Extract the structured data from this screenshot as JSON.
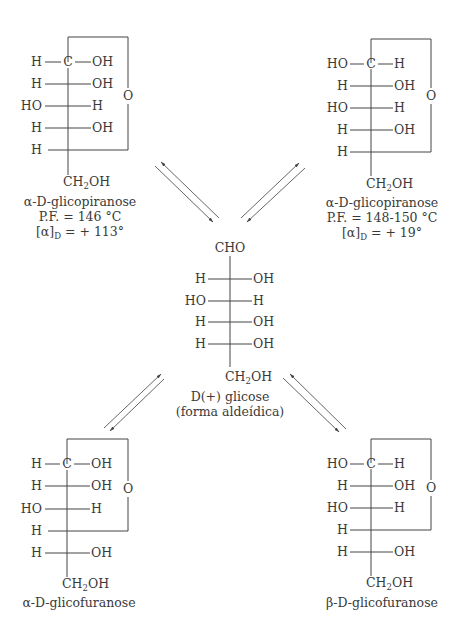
{
  "diagram": {
    "top_left": {
      "name": "α-D-glicopiranose",
      "ring_o": "O",
      "rows": [
        {
          "left": "H",
          "center": "C",
          "right": "OH"
        },
        {
          "left": "H",
          "right": "OH"
        },
        {
          "left": "HO",
          "right": "H"
        },
        {
          "left": "H",
          "right": "OH"
        },
        {
          "left": "H",
          "right": ""
        }
      ],
      "bottom": {
        "ch": "CH",
        "sub": "2",
        "oh": "OH"
      },
      "label": "α-D-glicopiranose",
      "pf": "P.F. = 146 °C",
      "rot_prefix": "[α]",
      "rot_sub": "D",
      "rot_value": " = + 113°"
    },
    "top_right": {
      "ring_o": "O",
      "rows": [
        {
          "left": "HO",
          "center": "C",
          "right": "H"
        },
        {
          "left": "H",
          "right": "OH"
        },
        {
          "left": "HO",
          "right": "H"
        },
        {
          "left": "H",
          "right": "OH"
        },
        {
          "left": "H",
          "right": ""
        }
      ],
      "bottom": {
        "ch": "CH",
        "sub": "2",
        "oh": "OH"
      },
      "label": "α-D-glicopiranose",
      "pf": "P.F. = 148-150 °C",
      "rot_prefix": "[α]",
      "rot_sub": "D",
      "rot_value": " = + 19°"
    },
    "center": {
      "top": "CHO",
      "rows": [
        {
          "left": "H",
          "right": "OH"
        },
        {
          "left": "HO",
          "right": "H"
        },
        {
          "left": "H",
          "right": "OH"
        },
        {
          "left": "H",
          "right": "OH"
        }
      ],
      "bottom": {
        "ch": "CH",
        "sub": "2",
        "oh": "OH"
      },
      "label1": "D(+) glicose",
      "label2": "(forma aldeídica)"
    },
    "bottom_left": {
      "ring_o": "O",
      "rows": [
        {
          "left": "H",
          "center": "C",
          "right": "OH"
        },
        {
          "left": "H",
          "right": "OH"
        },
        {
          "left": "HO",
          "right": "H"
        },
        {
          "left": "H",
          "right": ""
        },
        {
          "left": "H",
          "right": "OH"
        }
      ],
      "bottom": {
        "ch": "CH",
        "sub": "2",
        "oh": "OH"
      },
      "label": "α-D-glicofuranose"
    },
    "bottom_right": {
      "ring_o": "O",
      "rows": [
        {
          "left": "HO",
          "center": "C",
          "right": "H"
        },
        {
          "left": "H",
          "right": "OH"
        },
        {
          "left": "HO",
          "right": "H"
        },
        {
          "left": "H",
          "right": ""
        },
        {
          "left": "H",
          "right": "OH"
        }
      ],
      "bottom": {
        "ch": "CH",
        "sub": "2",
        "oh": "OH"
      },
      "label": "β-D-glicofuranose"
    }
  }
}
